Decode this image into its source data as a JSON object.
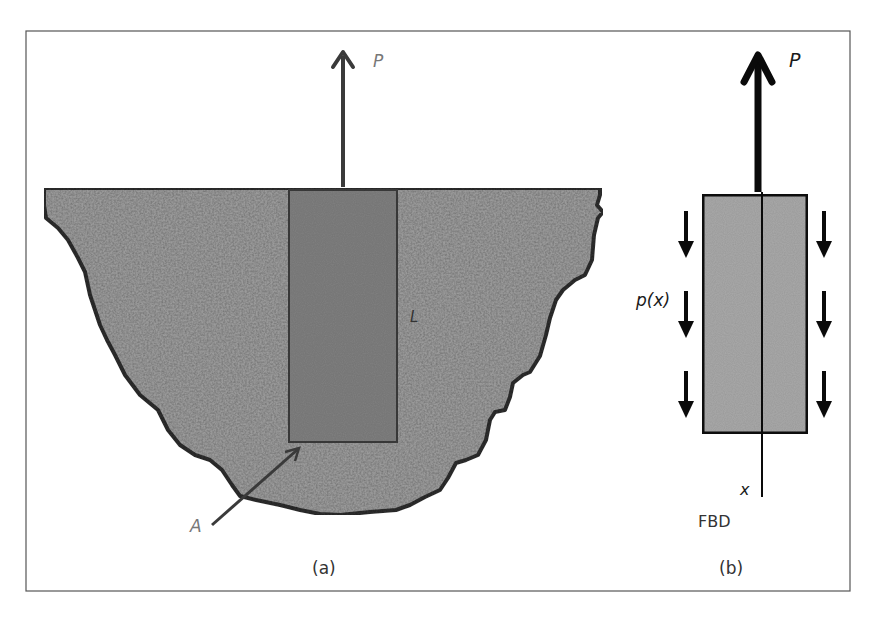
{
  "figure": {
    "panel_a": {
      "caption": "(a)",
      "force_label": "P",
      "length_label": "L",
      "area_label": "A"
    },
    "panel_b": {
      "caption": "(b)",
      "force_label": "P",
      "distributed_load_label": "p(x)",
      "axis_label": "x",
      "diagram_label": "FBD"
    }
  },
  "colors": {
    "frame": "#555555",
    "soil_fill": "#9a9a9a",
    "soil_outline": "#2e2e2e",
    "pile_fill_a": "#7e7e7e",
    "pile_fill_b": "#a8a8a8",
    "arrow_a": "#3a3a3a",
    "arrow_b": "#0a0a0a",
    "label_gray": "#777777"
  }
}
